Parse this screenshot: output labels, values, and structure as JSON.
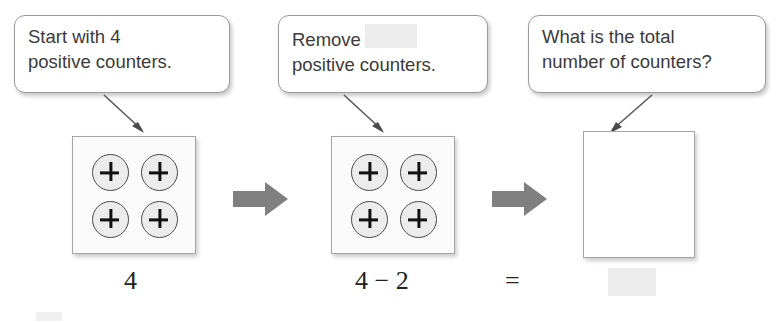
{
  "page": {
    "width": 780,
    "height": 323,
    "background": "#ffffff",
    "kind": "math-worksheet-diagram"
  },
  "colors": {
    "callout_border": "#9a9a9a",
    "callout_text": "#3b3b3b",
    "box_border": "#a6a6a6",
    "counter_fill": "#ececec",
    "counter_border": "#4a4a4a",
    "plus_sign": "#111111",
    "block_arrow": "#808080",
    "redacted_fill": "#ececec",
    "equation_text": "#222222"
  },
  "callouts": [
    {
      "id": "callout-start",
      "line1": "Start with 4",
      "line2": "positive counters.",
      "arrow_direction": "down-right"
    },
    {
      "id": "callout-remove",
      "line1_prefix": "Remove",
      "line1_redacted": true,
      "line2": "positive counters.",
      "arrow_direction": "down-right"
    },
    {
      "id": "callout-total",
      "line1": "What is the total",
      "line2": "number of counters?",
      "arrow_direction": "down-left"
    }
  ],
  "counter_boxes": [
    {
      "id": "box-start",
      "counter_count": 4,
      "counter_sign": "+",
      "empty": false
    },
    {
      "id": "box-after-remove",
      "counter_count": 4,
      "counter_sign": "+",
      "empty": false
    },
    {
      "id": "box-answer",
      "counter_count": 0,
      "counter_sign": "+",
      "empty": true
    }
  ],
  "block_arrows": [
    {
      "id": "arrow-1",
      "direction": "right"
    },
    {
      "id": "arrow-2",
      "direction": "right"
    }
  ],
  "equation": {
    "term1": "4",
    "term2": "4 − 2",
    "equals": "=",
    "answer_redacted": true
  },
  "icons": {
    "plus": "+",
    "minus": "−",
    "equals": "="
  }
}
